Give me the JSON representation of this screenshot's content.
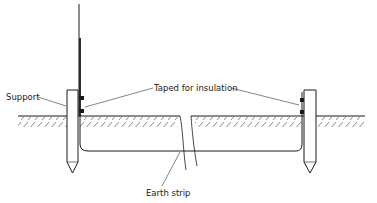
{
  "diagram": {
    "type": "technical-drawing",
    "labels": {
      "support": "Support",
      "taped": "Taped for insulation",
      "earth_strip": "Earth strip"
    },
    "colors": {
      "ink": "#1a1a1a",
      "background": "#ffffff"
    }
  }
}
